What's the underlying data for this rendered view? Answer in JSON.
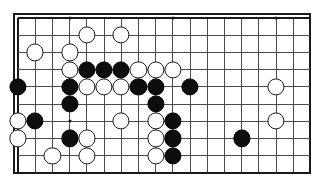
{
  "app": {
    "title": "Go Board Position Diagram",
    "kind": "go-goban-diagram"
  },
  "board": {
    "label": "Go board section",
    "columns": 18,
    "rows": 10,
    "cell_size_px": 17.2,
    "origin_x_px": 13,
    "origin_y_px": 13,
    "line_color": "#4c4c4c",
    "border_color": "#1a1a1a",
    "background_color": "#ffffff",
    "black_color": "#0d0d0d",
    "white_color": "#ffffff",
    "star_points": [
      {
        "col": 3,
        "row": 0
      },
      {
        "col": 9,
        "row": 0
      },
      {
        "col": 15,
        "row": 0
      },
      {
        "col": 3,
        "row": 6
      }
    ],
    "stones": [
      {
        "color": "white",
        "col": 4,
        "row": 1
      },
      {
        "color": "white",
        "col": 6,
        "row": 1
      },
      {
        "color": "white",
        "col": 1,
        "row": 2
      },
      {
        "color": "white",
        "col": 3,
        "row": 2
      },
      {
        "color": "white",
        "col": 3,
        "row": 3
      },
      {
        "color": "black",
        "col": 4,
        "row": 3
      },
      {
        "color": "black",
        "col": 5,
        "row": 3
      },
      {
        "color": "black",
        "col": 6,
        "row": 3
      },
      {
        "color": "white",
        "col": 7,
        "row": 3
      },
      {
        "color": "white",
        "col": 8,
        "row": 3
      },
      {
        "color": "white",
        "col": 9,
        "row": 3
      },
      {
        "color": "black",
        "col": 0,
        "row": 4
      },
      {
        "color": "black",
        "col": 3,
        "row": 4
      },
      {
        "color": "white",
        "col": 4,
        "row": 4
      },
      {
        "color": "white",
        "col": 5,
        "row": 4
      },
      {
        "color": "white",
        "col": 6,
        "row": 4
      },
      {
        "color": "black",
        "col": 7,
        "row": 4
      },
      {
        "color": "black",
        "col": 8,
        "row": 4
      },
      {
        "color": "black",
        "col": 10,
        "row": 4
      },
      {
        "color": "white",
        "col": 15,
        "row": 4
      },
      {
        "color": "black",
        "col": 3,
        "row": 5
      },
      {
        "color": "black",
        "col": 8,
        "row": 5
      },
      {
        "color": "white",
        "col": 0,
        "row": 6
      },
      {
        "color": "black",
        "col": 1,
        "row": 6
      },
      {
        "color": "white",
        "col": 6,
        "row": 6
      },
      {
        "color": "white",
        "col": 8,
        "row": 6
      },
      {
        "color": "black",
        "col": 9,
        "row": 6
      },
      {
        "color": "white",
        "col": 15,
        "row": 6
      },
      {
        "color": "white",
        "col": 0,
        "row": 7
      },
      {
        "color": "black",
        "col": 3,
        "row": 7
      },
      {
        "color": "white",
        "col": 4,
        "row": 7
      },
      {
        "color": "white",
        "col": 8,
        "row": 7
      },
      {
        "color": "black",
        "col": 9,
        "row": 7
      },
      {
        "color": "black",
        "col": 13,
        "row": 7
      },
      {
        "color": "white",
        "col": 2,
        "row": 8
      },
      {
        "color": "white",
        "col": 4,
        "row": 8
      },
      {
        "color": "white",
        "col": 8,
        "row": 8
      },
      {
        "color": "black",
        "col": 9,
        "row": 8
      }
    ]
  }
}
